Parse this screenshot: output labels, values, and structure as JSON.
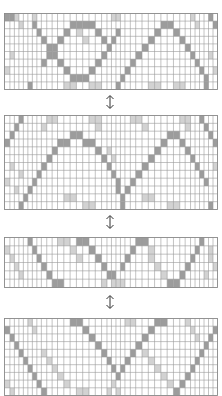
{
  "colors": {
    "line": "#9a9a9a",
    "dark": "#9c9c9c",
    "light": "#d2d2d2",
    "background": "#ffffff",
    "arrow": "#333333"
  },
  "arrows": [
    {
      "icon": "double-vertical-arrow-icon",
      "top": 94
    },
    {
      "icon": "double-vertical-arrow-icon",
      "top": 214
    },
    {
      "icon": "double-vertical-arrow-icon",
      "top": 294
    }
  ],
  "grids": [
    {
      "name": "pattern-grid-1",
      "top": 13,
      "width": 213,
      "height": 76,
      "cols": [
        6,
        5,
        5,
        5,
        5,
        5,
        5,
        5,
        6,
        6,
        6,
        7,
        7,
        7,
        7,
        7,
        7,
        7,
        6,
        5,
        5,
        5,
        5,
        6,
        6,
        7,
        7,
        7,
        7,
        7,
        7,
        7,
        6,
        6,
        5,
        5,
        5,
        5,
        5,
        5
      ],
      "rows": 10,
      "dark": [
        [
          0,
          0
        ],
        [
          1,
          0
        ],
        [
          6,
          1
        ],
        [
          7,
          2
        ],
        [
          8,
          3
        ],
        [
          9,
          4
        ],
        [
          10,
          5
        ],
        [
          11,
          6
        ],
        [
          12,
          7
        ],
        [
          13,
          8
        ],
        [
          14,
          8
        ],
        [
          15,
          8
        ],
        [
          16,
          7
        ],
        [
          17,
          6
        ],
        [
          18,
          5
        ],
        [
          19,
          4
        ],
        [
          20,
          3
        ],
        [
          21,
          2
        ],
        [
          8,
          6
        ],
        [
          9,
          5
        ],
        [
          10,
          4
        ],
        [
          11,
          3
        ],
        [
          12,
          2
        ],
        [
          13,
          1
        ],
        [
          14,
          1
        ],
        [
          15,
          1
        ],
        [
          16,
          1
        ],
        [
          17,
          2
        ],
        [
          18,
          3
        ],
        [
          19,
          4
        ],
        [
          22,
          8
        ],
        [
          23,
          7
        ],
        [
          24,
          6
        ],
        [
          25,
          5
        ],
        [
          26,
          4
        ],
        [
          27,
          3
        ],
        [
          28,
          2
        ],
        [
          29,
          1
        ],
        [
          30,
          1
        ],
        [
          31,
          2
        ],
        [
          32,
          3
        ],
        [
          33,
          4
        ],
        [
          34,
          5
        ],
        [
          35,
          6
        ],
        [
          36,
          7
        ],
        [
          37,
          8
        ],
        [
          21,
          9
        ],
        [
          37,
          9
        ],
        [
          38,
          0
        ],
        [
          39,
          1
        ],
        [
          5,
          9
        ]
      ],
      "light": [
        [
          2,
          0
        ],
        [
          3,
          1
        ],
        [
          1,
          5
        ],
        [
          0,
          7
        ],
        [
          12,
          9
        ],
        [
          13,
          9
        ],
        [
          16,
          9
        ],
        [
          17,
          9
        ],
        [
          27,
          9
        ],
        [
          28,
          9
        ],
        [
          31,
          9
        ],
        [
          32,
          9
        ],
        [
          6,
          0
        ],
        [
          34,
          0
        ],
        [
          35,
          1
        ],
        [
          38,
          5
        ],
        [
          39,
          7
        ],
        [
          20,
          0
        ],
        [
          21,
          0
        ],
        [
          14,
          2
        ],
        [
          15,
          3
        ]
      ]
    },
    {
      "name": "pattern-grid-2",
      "top": 115,
      "width": 213,
      "height": 94,
      "cols": [
        6,
        5,
        5,
        5,
        5,
        5,
        5,
        5,
        6,
        6,
        6,
        7,
        7,
        7,
        7,
        7,
        7,
        7,
        6,
        5,
        5,
        5,
        5,
        6,
        6,
        7,
        7,
        7,
        7,
        7,
        7,
        7,
        6,
        6,
        5,
        5,
        5,
        5,
        5,
        5
      ],
      "rows": 12,
      "dark": [
        [
          3,
          0
        ],
        [
          2,
          1
        ],
        [
          1,
          2
        ],
        [
          0,
          3
        ],
        [
          3,
          11
        ],
        [
          4,
          10
        ],
        [
          5,
          9
        ],
        [
          6,
          8
        ],
        [
          7,
          7
        ],
        [
          8,
          6
        ],
        [
          9,
          5
        ],
        [
          10,
          4
        ],
        [
          11,
          3
        ],
        [
          12,
          3
        ],
        [
          13,
          2
        ],
        [
          14,
          2
        ],
        [
          15,
          3
        ],
        [
          16,
          3
        ],
        [
          17,
          4
        ],
        [
          18,
          5
        ],
        [
          19,
          6
        ],
        [
          20,
          7
        ],
        [
          21,
          8
        ],
        [
          21,
          9
        ],
        [
          22,
          10
        ],
        [
          22,
          11
        ],
        [
          23,
          9
        ],
        [
          24,
          8
        ],
        [
          25,
          7
        ],
        [
          26,
          6
        ],
        [
          27,
          5
        ],
        [
          28,
          4
        ],
        [
          29,
          3
        ],
        [
          30,
          2
        ],
        [
          31,
          2
        ],
        [
          32,
          3
        ],
        [
          33,
          4
        ],
        [
          34,
          5
        ],
        [
          35,
          6
        ],
        [
          36,
          7
        ],
        [
          37,
          8
        ],
        [
          38,
          11
        ],
        [
          36,
          0
        ],
        [
          37,
          1
        ],
        [
          38,
          2
        ],
        [
          39,
          3
        ]
      ],
      "light": [
        [
          9,
          0
        ],
        [
          10,
          0
        ],
        [
          8,
          1
        ],
        [
          1,
          6
        ],
        [
          0,
          8
        ],
        [
          16,
          0
        ],
        [
          17,
          0
        ],
        [
          17,
          1
        ],
        [
          24,
          0
        ],
        [
          25,
          0
        ],
        [
          26,
          1
        ],
        [
          32,
          0
        ],
        [
          33,
          0
        ],
        [
          33,
          1
        ],
        [
          39,
          6
        ],
        [
          12,
          10
        ],
        [
          13,
          10
        ],
        [
          26,
          10
        ],
        [
          27,
          10
        ],
        [
          15,
          11
        ],
        [
          16,
          11
        ],
        [
          30,
          11
        ],
        [
          31,
          11
        ],
        [
          19,
          4
        ],
        [
          20,
          5
        ],
        [
          3,
          7
        ],
        [
          2,
          9
        ]
      ]
    },
    {
      "name": "pattern-grid-3",
      "top": 237,
      "width": 213,
      "height": 50,
      "cols": [
        6,
        5,
        5,
        5,
        5,
        5,
        5,
        5,
        6,
        6,
        6,
        7,
        7,
        7,
        7,
        7,
        7,
        7,
        6,
        5,
        5,
        5,
        5,
        6,
        6,
        7,
        7,
        7,
        7,
        7,
        7,
        7,
        6,
        6,
        5,
        5,
        5,
        5,
        5,
        5
      ],
      "rows": 6,
      "dark": [
        [
          5,
          0
        ],
        [
          6,
          1
        ],
        [
          7,
          2
        ],
        [
          8,
          3
        ],
        [
          9,
          4
        ],
        [
          10,
          5
        ],
        [
          11,
          5
        ],
        [
          14,
          0
        ],
        [
          15,
          0
        ],
        [
          16,
          1
        ],
        [
          17,
          2
        ],
        [
          18,
          3
        ],
        [
          19,
          4
        ],
        [
          20,
          4
        ],
        [
          22,
          3
        ],
        [
          23,
          2
        ],
        [
          24,
          1
        ],
        [
          25,
          0
        ],
        [
          26,
          0
        ],
        [
          30,
          5
        ],
        [
          31,
          5
        ],
        [
          32,
          4
        ],
        [
          33,
          3
        ],
        [
          34,
          2
        ],
        [
          35,
          1
        ],
        [
          36,
          0
        ]
      ],
      "light": [
        [
          11,
          0
        ],
        [
          12,
          0
        ],
        [
          13,
          1
        ],
        [
          14,
          2
        ],
        [
          0,
          1
        ],
        [
          1,
          2
        ],
        [
          2,
          3
        ],
        [
          3,
          4
        ],
        [
          21,
          5
        ],
        [
          22,
          5
        ],
        [
          20,
          5
        ],
        [
          27,
          1
        ],
        [
          27,
          2
        ],
        [
          28,
          3
        ],
        [
          29,
          4
        ],
        [
          38,
          1
        ],
        [
          38,
          2
        ],
        [
          39,
          3
        ],
        [
          37,
          4
        ],
        [
          18,
          5
        ]
      ]
    },
    {
      "name": "pattern-grid-4",
      "top": 318,
      "width": 213,
      "height": 77,
      "cols": [
        6,
        5,
        5,
        5,
        5,
        5,
        5,
        5,
        6,
        6,
        6,
        7,
        7,
        7,
        7,
        7,
        7,
        7,
        6,
        5,
        5,
        5,
        5,
        6,
        6,
        7,
        7,
        7,
        7,
        7,
        7,
        7,
        6,
        6,
        5,
        5,
        5,
        5,
        5,
        5
      ],
      "rows": 10,
      "dark": [
        [
          0,
          1
        ],
        [
          1,
          2
        ],
        [
          2,
          3
        ],
        [
          3,
          4
        ],
        [
          4,
          5
        ],
        [
          5,
          6
        ],
        [
          6,
          7
        ],
        [
          7,
          8
        ],
        [
          8,
          9
        ],
        [
          13,
          0
        ],
        [
          14,
          0
        ],
        [
          15,
          1
        ],
        [
          16,
          2
        ],
        [
          17,
          3
        ],
        [
          18,
          4
        ],
        [
          19,
          5
        ],
        [
          20,
          6
        ],
        [
          21,
          7
        ],
        [
          22,
          6
        ],
        [
          23,
          5
        ],
        [
          24,
          4
        ],
        [
          25,
          3
        ],
        [
          26,
          2
        ],
        [
          27,
          1
        ],
        [
          28,
          0
        ],
        [
          29,
          0
        ],
        [
          39,
          1
        ],
        [
          38,
          2
        ],
        [
          37,
          3
        ],
        [
          36,
          4
        ],
        [
          35,
          5
        ],
        [
          34,
          6
        ],
        [
          33,
          7
        ],
        [
          32,
          8
        ],
        [
          31,
          9
        ]
      ],
      "light": [
        [
          5,
          0
        ],
        [
          6,
          1
        ],
        [
          8,
          4
        ],
        [
          9,
          5
        ],
        [
          10,
          6
        ],
        [
          11,
          7
        ],
        [
          12,
          8
        ],
        [
          23,
          0
        ],
        [
          24,
          0
        ],
        [
          26,
          4
        ],
        [
          27,
          5
        ],
        [
          28,
          6
        ],
        [
          29,
          7
        ],
        [
          30,
          8
        ],
        [
          33,
          0
        ],
        [
          34,
          1
        ],
        [
          35,
          2
        ],
        [
          0,
          8
        ],
        [
          1,
          9
        ],
        [
          19,
          9
        ],
        [
          20,
          8
        ],
        [
          21,
          9
        ],
        [
          14,
          9
        ],
        [
          15,
          9
        ]
      ]
    }
  ]
}
